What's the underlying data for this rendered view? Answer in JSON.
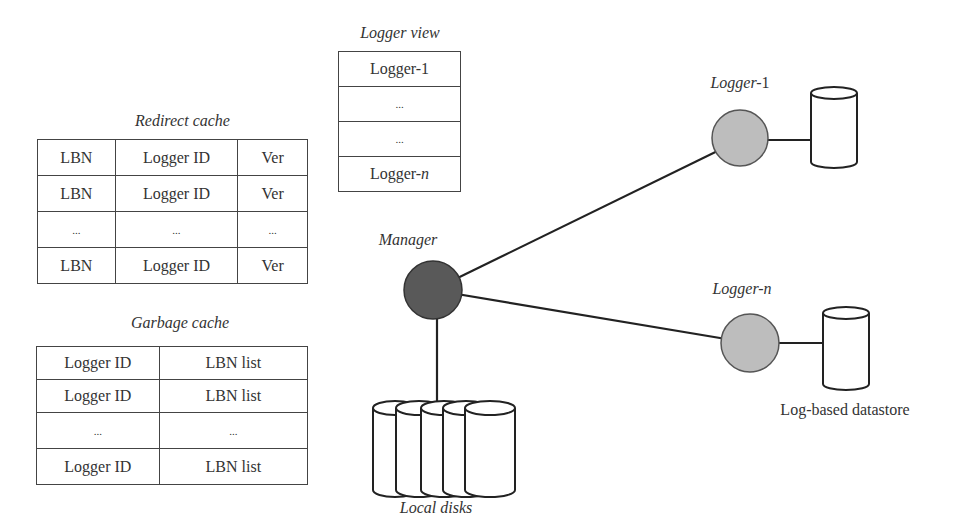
{
  "redirect_cache": {
    "title": "Redirect cache",
    "rows": [
      [
        "LBN",
        "Logger ID",
        "Ver"
      ],
      [
        "LBN",
        "Logger ID",
        "Ver"
      ],
      [
        "...",
        "...",
        "..."
      ],
      [
        "LBN",
        "Logger ID",
        "Ver"
      ]
    ]
  },
  "garbage_cache": {
    "title": "Garbage cache",
    "rows": [
      [
        "Logger ID",
        "LBN list"
      ],
      [
        "Logger ID",
        "LBN list"
      ],
      [
        "...",
        "..."
      ],
      [
        "Logger ID",
        "LBN list"
      ]
    ]
  },
  "logger_view": {
    "title": "Logger view",
    "rows": [
      {
        "prefix": "Logger-",
        "suffix": "1",
        "suffix_italic": false
      },
      {
        "prefix": "...",
        "suffix": "",
        "suffix_italic": false
      },
      {
        "prefix": "...",
        "suffix": "",
        "suffix_italic": false
      },
      {
        "prefix": "Logger-",
        "suffix": "n",
        "suffix_italic": true
      }
    ]
  },
  "nodes": {
    "manager": {
      "label": "Manager",
      "color": "#595959"
    },
    "logger_1": {
      "label_prefix": "Logger-",
      "label_suffix": "1",
      "color": "#bdbdbd"
    },
    "logger_n": {
      "label_prefix": "Logger-",
      "label_suffix": "n",
      "color": "#bdbdbd"
    }
  },
  "local_disks": {
    "label": "Local disks",
    "count": 5
  },
  "datastore": {
    "label": "Log-based datastore"
  },
  "colors": {
    "line": "#222222",
    "table_border": "#444444"
  }
}
